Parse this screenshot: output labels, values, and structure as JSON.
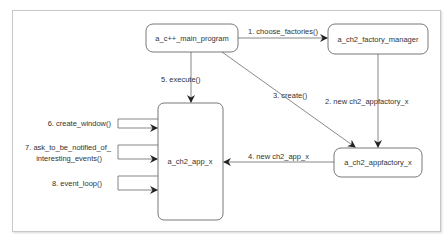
{
  "diagram": {
    "type": "collaboration",
    "nodes": [
      {
        "id": "main",
        "label": "a_c++_main_program"
      },
      {
        "id": "factory_manager",
        "label": "a_ch2_factory_manager"
      },
      {
        "id": "appfactory",
        "label": "a_ch2_appfactory_x"
      },
      {
        "id": "app",
        "label": "a_ch2_app_x"
      }
    ],
    "edges": [
      {
        "from": "main",
        "to": "factory_manager",
        "label": "1. choose_factories()"
      },
      {
        "from": "factory_manager",
        "to": "appfactory",
        "label": "2. new ch2_appfactory_x"
      },
      {
        "from": "main",
        "to": "appfactory",
        "label": "3. create()"
      },
      {
        "from": "appfactory",
        "to": "app",
        "label": "4. new ch2_app_x"
      },
      {
        "from": "main",
        "to": "app",
        "label": "5. execute()"
      },
      {
        "from": "app",
        "to": "app",
        "label": "6. create_window()"
      },
      {
        "from": "app",
        "to": "app",
        "label_lines": [
          "7. ask_to_be_notified_of_",
          "interesting_events()"
        ]
      },
      {
        "from": "app",
        "to": "app",
        "label": "8. event_loop()"
      }
    ]
  }
}
